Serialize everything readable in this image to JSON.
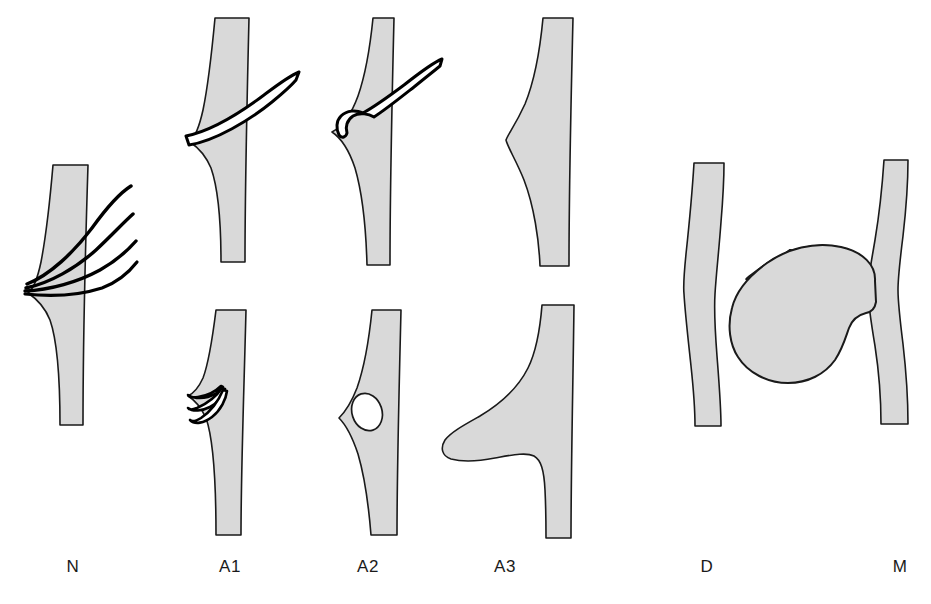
{
  "figure": {
    "background_color": "#ffffff",
    "fill_color": "#d9d9d9",
    "stroke_color": "#1a1a1a",
    "line_color": "#000000",
    "width": 931,
    "height": 604
  },
  "panels": [
    {
      "id": "N",
      "label": "N",
      "label_x": 73,
      "label_y": 566,
      "description": "Normal: vessel band with left-side bulge and four slender filaments fanning out to the upper right from a convergence point",
      "filament_count": 4,
      "rows": 1
    },
    {
      "id": "A1",
      "label": "A1",
      "label_x": 230,
      "label_y": 566,
      "description": "Stage A1: upper figure shows two parallel lines crossing the bulge diagonally; lower figure shows three short truncated filament stubs within a small bulge",
      "filament_count": 2,
      "rows": 2
    },
    {
      "id": "A2",
      "label": "A2",
      "label_x": 368,
      "label_y": 566,
      "description": "Stage A2: upper figure shows a blunt rounded terminal cap at the end of two parallel lines; lower figure shows a small oval lumen enclosed within the bulge",
      "filament_count": 1,
      "rows": 2
    },
    {
      "id": "A3",
      "label": "A3",
      "label_x": 505,
      "label_y": 566,
      "description": "Stage A3: upper figure is a smooth rounded bulge with no filaments; lower figure is a large pendulous lobe protruding to the left",
      "filament_count": 0,
      "rows": 2
    },
    {
      "id": "D",
      "label": "D",
      "label_x": 707,
      "label_y": 566,
      "description": "D: narrow band with a gentle central waist or constriction",
      "filament_count": 0,
      "rows": 1
    },
    {
      "id": "M",
      "label": "M",
      "label_x": 900,
      "label_y": 566,
      "description": "M: large kidney-shaped mass abutting the left side of a narrow band",
      "filament_count": 0,
      "rows": 1
    }
  ]
}
